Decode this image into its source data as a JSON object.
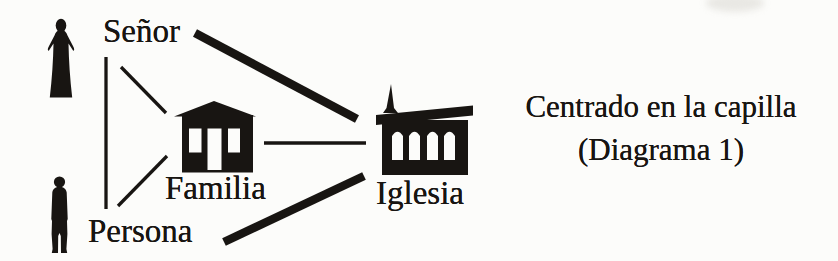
{
  "page": {
    "background": "#fcfcfa",
    "ink": "#181512",
    "kind": "scanned book diagram"
  },
  "caption": {
    "line1": "Centrado en la capilla",
    "line2": "(Diagrama 1)"
  },
  "nodes": {
    "senor": {
      "label": "Señor",
      "icon": "robed-figure-icon"
    },
    "persona": {
      "label": "Persona",
      "icon": "standing-person-icon"
    },
    "familia": {
      "label": "Familia",
      "icon": "house-icon"
    },
    "iglesia": {
      "label": "Iglesia",
      "icon": "church-icon"
    }
  },
  "edges": [
    {
      "from": "Señor",
      "to": "Persona",
      "weight": "thin"
    },
    {
      "from": "Señor",
      "to": "Familia",
      "weight": "thin"
    },
    {
      "from": "Persona",
      "to": "Familia",
      "weight": "thin"
    },
    {
      "from": "Señor",
      "to": "Iglesia",
      "weight": "thick"
    },
    {
      "from": "Familia",
      "to": "Iglesia",
      "weight": "thin"
    },
    {
      "from": "Persona",
      "to": "Iglesia",
      "weight": "thick"
    }
  ]
}
